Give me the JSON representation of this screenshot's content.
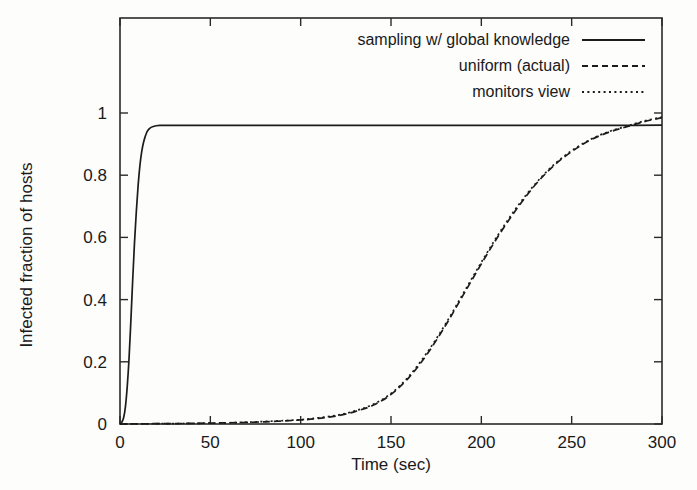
{
  "chart_data": {
    "type": "line",
    "title": "",
    "xlabel": "Time (sec)",
    "ylabel": "Infected fraction of hosts",
    "xlim": [
      0,
      300
    ],
    "ylim": [
      0,
      1.04
    ],
    "xticks": [
      0,
      50,
      100,
      150,
      200,
      250,
      300
    ],
    "xtick_labels": [
      "0",
      "50",
      "100",
      "150",
      "200",
      "250",
      "300"
    ],
    "yticks": [
      0,
      0.2,
      0.4,
      0.6,
      0.8,
      1
    ],
    "ytick_labels": [
      "0",
      "0.2",
      "0.4",
      "0.6",
      "0.8",
      "1"
    ],
    "grid": false,
    "legend_position": "top-right-inside",
    "series": [
      {
        "name": "sampling w/ global knowledge",
        "style": "solid",
        "x": [
          0,
          1,
          2,
          3,
          4,
          5,
          6,
          7,
          8,
          9,
          10,
          11,
          12,
          13,
          14,
          15,
          16,
          17,
          18,
          20,
          22,
          25,
          30,
          40,
          50,
          75,
          100,
          125,
          150,
          175,
          200,
          225,
          250,
          275,
          300
        ],
        "y": [
          0.0,
          0.006,
          0.02,
          0.055,
          0.12,
          0.21,
          0.33,
          0.46,
          0.58,
          0.68,
          0.765,
          0.83,
          0.875,
          0.905,
          0.925,
          0.94,
          0.948,
          0.953,
          0.956,
          0.959,
          0.96,
          0.96,
          0.96,
          0.96,
          0.96,
          0.96,
          0.96,
          0.96,
          0.96,
          0.96,
          0.96,
          0.96,
          0.96,
          0.96,
          0.961
        ]
      },
      {
        "name": "uniform (actual)",
        "style": "dashed",
        "x": [
          0,
          20,
          40,
          60,
          80,
          100,
          110,
          120,
          130,
          140,
          150,
          160,
          170,
          180,
          190,
          200,
          210,
          220,
          230,
          240,
          250,
          260,
          270,
          280,
          290,
          300
        ],
        "y": [
          0.0,
          0.001,
          0.002,
          0.004,
          0.007,
          0.013,
          0.018,
          0.026,
          0.04,
          0.06,
          0.095,
          0.15,
          0.225,
          0.315,
          0.415,
          0.515,
          0.61,
          0.695,
          0.77,
          0.83,
          0.876,
          0.912,
          0.937,
          0.955,
          0.972,
          0.985
        ]
      },
      {
        "name": "monitors view",
        "style": "dotted",
        "x": [
          0,
          20,
          40,
          60,
          80,
          100,
          110,
          120,
          130,
          140,
          150,
          160,
          170,
          180,
          190,
          200,
          210,
          220,
          230,
          240,
          250,
          260,
          270,
          280,
          290,
          300
        ],
        "y": [
          0.0,
          0.001,
          0.002,
          0.004,
          0.008,
          0.014,
          0.02,
          0.028,
          0.042,
          0.063,
          0.098,
          0.154,
          0.23,
          0.32,
          0.42,
          0.52,
          0.615,
          0.7,
          0.773,
          0.833,
          0.879,
          0.914,
          0.939,
          0.957,
          0.974,
          0.987
        ]
      }
    ]
  },
  "legend": {
    "entries": [
      {
        "label": "sampling w/ global knowledge",
        "style": "solid"
      },
      {
        "label": "uniform (actual)",
        "style": "dashed"
      },
      {
        "label": "monitors view",
        "style": "dotted"
      }
    ]
  },
  "colors": {
    "ink": "#1c1c1c",
    "frame": "#2a2a2a",
    "background": "#fdfdfb"
  }
}
